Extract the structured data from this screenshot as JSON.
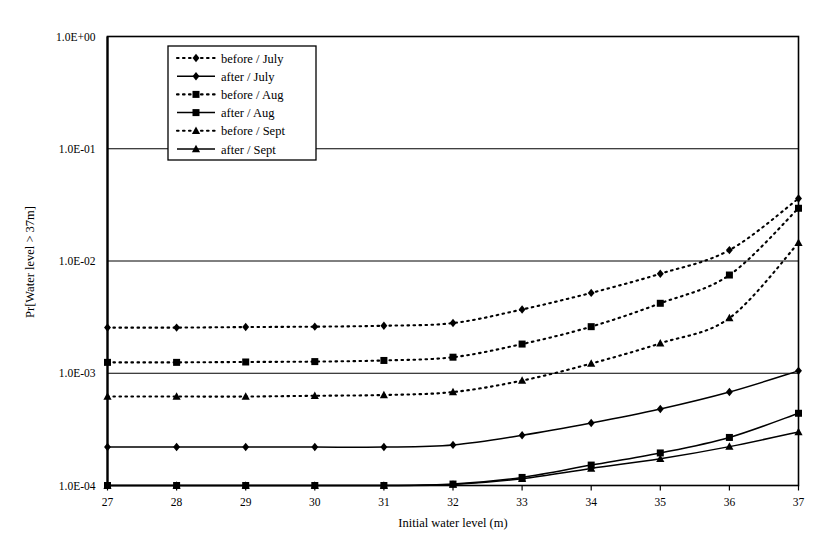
{
  "chart_data": {
    "type": "line",
    "title": "",
    "xlabel": "Initial water level (m)",
    "ylabel": "Pr[Water level > 37m]",
    "yscale": "log",
    "xlim": [
      27,
      37
    ],
    "ylim": [
      0.0001,
      1
    ],
    "grid": "horizontal",
    "legend_position": "top-left-inside",
    "x": [
      27,
      28,
      29,
      30,
      31,
      32,
      33,
      34,
      35,
      36,
      37
    ],
    "xticklabels": [
      "27",
      "28",
      "29",
      "30",
      "31",
      "32",
      "33",
      "34",
      "35",
      "36",
      "37"
    ],
    "yticklabels": [
      "1.0E+00",
      "1.0E-01",
      "1.0E-02",
      "1.0E-03",
      "1.0E-04"
    ],
    "ytickvalues": [
      1,
      0.1,
      0.01,
      0.001,
      0.0001
    ],
    "series": [
      {
        "name": "before / July",
        "style": "dotted",
        "marker": "diamond",
        "values": [
          0.00255,
          0.00255,
          0.00258,
          0.0026,
          0.00265,
          0.0028,
          0.0037,
          0.0052,
          0.0077,
          0.0125,
          0.036
        ]
      },
      {
        "name": "after / July",
        "style": "solid",
        "marker": "diamond",
        "values": [
          0.00022,
          0.00022,
          0.00022,
          0.00022,
          0.00022,
          0.00023,
          0.00028,
          0.00036,
          0.00048,
          0.00068,
          0.00105
        ]
      },
      {
        "name": "before / Aug",
        "style": "dotted",
        "marker": "square",
        "values": [
          0.00125,
          0.00125,
          0.00126,
          0.00127,
          0.0013,
          0.00139,
          0.00182,
          0.0026,
          0.0042,
          0.0075,
          0.0295
        ]
      },
      {
        "name": "after / Aug",
        "style": "solid",
        "marker": "square",
        "values": [
          0.0001,
          0.0001,
          0.0001,
          0.0001,
          0.0001,
          0.000103,
          0.000118,
          0.000152,
          0.000195,
          0.000268,
          0.00044
        ]
      },
      {
        "name": "before / Sept",
        "style": "dotted",
        "marker": "triangle",
        "values": [
          0.00062,
          0.00062,
          0.00062,
          0.00063,
          0.00064,
          0.00068,
          0.00086,
          0.00122,
          0.00185,
          0.0031,
          0.0145
        ]
      },
      {
        "name": "after / Sept",
        "style": "solid",
        "marker": "triangle",
        "values": [
          0.0001,
          0.0001,
          0.0001,
          0.0001,
          0.0001,
          0.000102,
          0.000115,
          0.000142,
          0.000173,
          0.000222,
          0.0003
        ]
      }
    ]
  },
  "legend": {
    "items": [
      {
        "label": "before / July"
      },
      {
        "label": "after / July"
      },
      {
        "label": "before / Aug"
      },
      {
        "label": "after / Aug"
      },
      {
        "label": "before / Sept"
      },
      {
        "label": "after / Sept"
      }
    ]
  },
  "colors": {
    "line": "#000000",
    "grid": "#000000",
    "frame": "#000000",
    "background": "#ffffff"
  }
}
